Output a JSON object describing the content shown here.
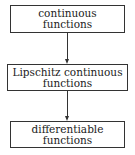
{
  "diagram": {
    "nodes": [
      {
        "id": "continuous",
        "lines": [
          "continuous",
          "functions"
        ]
      },
      {
        "id": "lipschitz",
        "lines": [
          "Lipschitz continuous",
          "functions"
        ]
      },
      {
        "id": "differentiable",
        "lines": [
          "differentiable",
          "functions"
        ]
      }
    ],
    "edges": [
      {
        "from": "continuous",
        "to": "lipschitz"
      },
      {
        "from": "lipschitz",
        "to": "differentiable"
      }
    ]
  }
}
